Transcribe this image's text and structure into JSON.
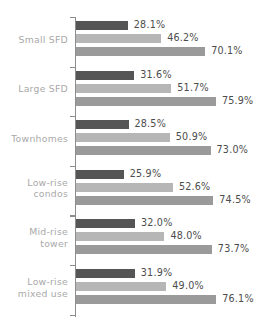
{
  "chart_data": {
    "type": "bar",
    "orientation": "horizontal",
    "title": "",
    "subtitle": "",
    "xlabel": "",
    "ylabel": "",
    "xlim": [
      0,
      100
    ],
    "grid": false,
    "legend": "none",
    "value_suffix": "%",
    "categories": [
      "Small SFD",
      "Large SFD",
      "Townhomes",
      "Low-rise\ncondos",
      "Mid-rise\ntower",
      "Low-rise\nmixed use"
    ],
    "series": [
      {
        "name": "series-1",
        "color": "#555555",
        "values": [
          28.1,
          31.6,
          28.5,
          25.9,
          32.0,
          31.9
        ],
        "labels": [
          "28.1%",
          "31.6%",
          "28.5%",
          "25.9%",
          "32.0%",
          "31.9%"
        ]
      },
      {
        "name": "series-2",
        "color": "#b6b6b6",
        "values": [
          46.2,
          51.7,
          50.9,
          52.6,
          48.0,
          49.0
        ],
        "labels": [
          "46.2%",
          "51.7%",
          "50.9%",
          "52.6%",
          "48.0%",
          "49.0%"
        ]
      },
      {
        "name": "series-3",
        "color": "#9a9a9a",
        "values": [
          70.1,
          75.9,
          73.0,
          74.5,
          73.7,
          76.1
        ],
        "labels": [
          "70.1%",
          "75.9%",
          "73.0%",
          "74.5%",
          "73.7%",
          "76.1%"
        ]
      }
    ]
  },
  "axis": {
    "spine_color": "#8d8d8d",
    "category_label_color": "#a9a9a9",
    "value_label_color": "#4c4c4c"
  }
}
